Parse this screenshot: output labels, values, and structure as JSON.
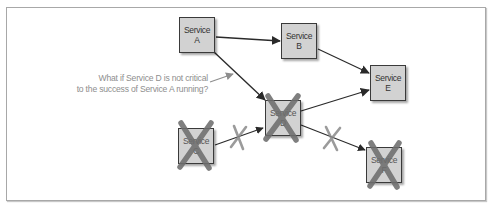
{
  "diagram": {
    "nodes": [
      {
        "id": "A",
        "line1": "Service",
        "line2": "A",
        "status": "running"
      },
      {
        "id": "B",
        "line1": "Service",
        "line2": "B",
        "status": "running"
      },
      {
        "id": "E",
        "line1": "Service",
        "line2": "E",
        "status": "running"
      },
      {
        "id": "D",
        "line1": "Service",
        "line2": "D",
        "status": "failed"
      },
      {
        "id": "C",
        "line1": "Service",
        "line2": "C",
        "status": "failed"
      },
      {
        "id": "F",
        "line1": "Service",
        "line2": "F",
        "status": "failed"
      }
    ],
    "edges": [
      {
        "from": "A",
        "to": "B",
        "broken": false
      },
      {
        "from": "A",
        "to": "D",
        "broken": false
      },
      {
        "from": "B",
        "to": "E",
        "broken": false
      },
      {
        "from": "D",
        "to": "E",
        "broken": false
      },
      {
        "from": "C",
        "to": "D",
        "broken": true
      },
      {
        "from": "D",
        "to": "F",
        "broken": true
      }
    ],
    "annotation": {
      "line1": "What if Service D is not critical",
      "line2": "to the success of Service A running?"
    },
    "colors": {
      "node_fill": "#d2d2d2",
      "node_border": "#3a3a3a",
      "edge": "#2a2a2a",
      "failure_mark": "#7a7a7a",
      "annotation_text": "#8e8e8e"
    }
  }
}
